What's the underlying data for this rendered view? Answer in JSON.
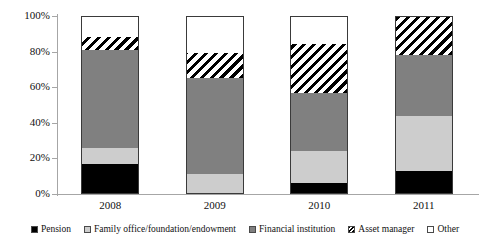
{
  "chart_data": {
    "type": "bar",
    "subtype": "stacked-percentage",
    "title": "",
    "xlabel": "",
    "ylabel": "",
    "categories": [
      "2008",
      "2009",
      "2010",
      "2011"
    ],
    "ylim": [
      0,
      100
    ],
    "ytick_labels": [
      "0%",
      "20%",
      "40%",
      "60%",
      "80%",
      "100%"
    ],
    "ytick_values": [
      0,
      20,
      40,
      60,
      80,
      100
    ],
    "grid": false,
    "legend_position": "bottom",
    "series": [
      {
        "name": "Pension",
        "color": "#000000",
        "pattern": "solid",
        "values": [
          17,
          0,
          6,
          13
        ]
      },
      {
        "name": "Family office/foundation/endowment",
        "color": "#cdcdcd",
        "pattern": "solid",
        "values": [
          9,
          11,
          18,
          31
        ]
      },
      {
        "name": "Financial institution",
        "color": "#808080",
        "pattern": "solid",
        "values": [
          55,
          54,
          33,
          34
        ]
      },
      {
        "name": "Asset manager",
        "color": "#000000",
        "pattern": "diagonal-hatch",
        "values": [
          7,
          14,
          27,
          22
        ]
      },
      {
        "name": "Other",
        "color": "#ffffff",
        "pattern": "solid",
        "values": [
          12,
          21,
          16,
          0
        ]
      }
    ]
  },
  "axis": {
    "ticks": [
      {
        "label": "100%",
        "value": 100
      },
      {
        "label": "80%",
        "value": 80
      },
      {
        "label": "60%",
        "value": 60
      },
      {
        "label": "40%",
        "value": 40
      },
      {
        "label": "20%",
        "value": 20
      },
      {
        "label": "0%",
        "value": 0
      }
    ]
  },
  "legend": {
    "items": [
      {
        "label": "Pension",
        "swatch": "pension-swatch-icon"
      },
      {
        "label": "Family office/foundation/endowment",
        "swatch": "family-office-swatch-icon"
      },
      {
        "label": "Financial institution",
        "swatch": "financial-institution-swatch-icon"
      },
      {
        "label": "Asset manager",
        "swatch": "asset-manager-swatch-icon"
      },
      {
        "label": "Other",
        "swatch": "other-swatch-icon"
      }
    ]
  }
}
